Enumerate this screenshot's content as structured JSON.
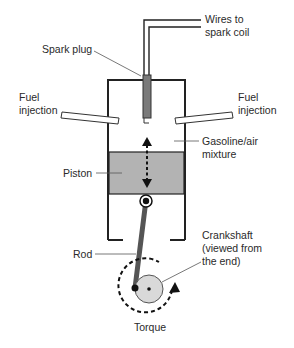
{
  "diagram": {
    "labels": {
      "wires": [
        "Wires to",
        "spark coil"
      ],
      "spark_plug": "Spark plug",
      "fuel_injection_left": [
        "Fuel",
        "injection"
      ],
      "fuel_injection_right": [
        "Fuel",
        "injection"
      ],
      "mixture": [
        "Gasoline/air",
        "mixture"
      ],
      "piston": "Piston",
      "rod": "Rod",
      "crankshaft": [
        "Crankshaft",
        "(viewed from",
        "the end)"
      ],
      "torque": "Torque"
    },
    "colors": {
      "piston_fill": "#b3b3b3",
      "spark_plug_fill": "#7a7a7a",
      "rod_fill": "#555555",
      "crank_fill": "#d9d9d9",
      "line": "#222222"
    }
  }
}
